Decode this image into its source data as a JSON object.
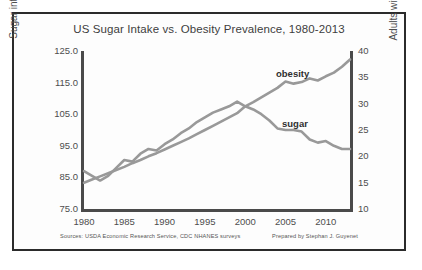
{
  "figure": {
    "title": "US Sugar Intake vs. Obesity Prevalence, 1980-2013",
    "footer_sources": "Sources: USDA Economic Research Service, CDC NHANES surveys",
    "footer_credit": "Prepared by Stephan J. Guyenet",
    "frame_color": "#2b2b2b",
    "axis_color": "#4a4a4a",
    "series_color": "#999999"
  },
  "chart_data": {
    "type": "line",
    "title": "US Sugar Intake vs. Obesity Prevalence, 1980-2013",
    "xlabel": "",
    "ylabel": "Sugar intake (g/person/day)",
    "y2label": "Adults with obesity (%)",
    "xlim": [
      1980,
      2013
    ],
    "ylim": [
      75.0,
      125.0
    ],
    "y2lim": [
      10,
      40
    ],
    "grid": false,
    "legend_position": "inline-annotations",
    "xticks": [
      "1980",
      "1985",
      "1990",
      "1995",
      "2000",
      "2005",
      "2010"
    ],
    "xtick_values": [
      1980,
      1985,
      1990,
      1995,
      2000,
      2005,
      2010
    ],
    "yticks_left": [
      "125.0",
      "115.0",
      "105.0",
      "95.0",
      "85.0",
      "75.0"
    ],
    "ytick_left_values": [
      125.0,
      115.0,
      105.0,
      95.0,
      85.0,
      75.0
    ],
    "yticks_right": [
      "40",
      "35",
      "30",
      "25",
      "20",
      "15",
      "10"
    ],
    "ytick_right_values": [
      40,
      35,
      30,
      25,
      20,
      15,
      10
    ],
    "x": [
      1980,
      1981,
      1982,
      1983,
      1984,
      1985,
      1986,
      1987,
      1988,
      1989,
      1990,
      1991,
      1992,
      1993,
      1994,
      1995,
      1996,
      1997,
      1998,
      1999,
      2000,
      2001,
      2002,
      2003,
      2004,
      2005,
      2006,
      2007,
      2008,
      2009,
      2010,
      2011,
      2012,
      2013
    ],
    "series": [
      {
        "name": "sugar",
        "label": "sugar",
        "axis": "left",
        "units": "g/person/day",
        "color": "#999999",
        "values": [
          87.0,
          85.5,
          84.0,
          85.5,
          88.0,
          90.5,
          90.0,
          92.5,
          94.0,
          93.5,
          95.5,
          97.0,
          99.0,
          100.5,
          102.5,
          104.0,
          105.5,
          106.5,
          107.5,
          109.0,
          107.5,
          106.5,
          105.0,
          103.0,
          100.5,
          100.0,
          100.0,
          99.5,
          97.0,
          96.0,
          96.5,
          95.0,
          94.0,
          94.0
        ]
      },
      {
        "name": "obesity",
        "label": "obesity",
        "axis": "right",
        "units": "%",
        "color": "#999999",
        "values": [
          15.0,
          15.6,
          16.2,
          16.8,
          17.4,
          18.0,
          18.7,
          19.3,
          20.0,
          20.6,
          21.3,
          22.0,
          22.7,
          23.4,
          24.2,
          25.0,
          25.8,
          26.6,
          27.4,
          28.2,
          29.5,
          30.3,
          31.2,
          32.1,
          33.0,
          34.2,
          33.8,
          34.1,
          34.8,
          34.4,
          35.2,
          35.9,
          37.0,
          38.4
        ]
      }
    ],
    "annotations": [
      {
        "text": "obesity",
        "x": 2006,
        "y_axis": "right",
        "y": 39.5
      },
      {
        "text": "sugar",
        "x": 2006,
        "y_axis": "left",
        "y": 103.0
      }
    ]
  }
}
